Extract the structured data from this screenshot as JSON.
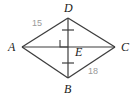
{
  "figure": {
    "name": "rhombus-abcd-with-diagonals",
    "shape_type": "rhombus",
    "vertices": [
      {
        "id": "A",
        "label": "A",
        "x": 22,
        "y": 47,
        "label_x": 8,
        "label_y": 51
      },
      {
        "id": "D",
        "label": "D",
        "x": 68,
        "y": 18,
        "label_x": 64,
        "label_y": 12
      },
      {
        "id": "C",
        "label": "C",
        "x": 115,
        "y": 47,
        "label_x": 121,
        "label_y": 51
      },
      {
        "id": "B",
        "label": "B",
        "x": 68,
        "y": 78,
        "label_x": 64,
        "label_y": 93
      }
    ],
    "intersection": {
      "id": "E",
      "label": "E",
      "x": 68,
      "y": 47,
      "label_x": 75,
      "label_y": 56
    },
    "sides": [
      {
        "from": "A",
        "to": "D"
      },
      {
        "from": "D",
        "to": "C"
      },
      {
        "from": "C",
        "to": "B"
      },
      {
        "from": "B",
        "to": "A"
      }
    ],
    "diagonals": [
      {
        "from": "A",
        "to": "C",
        "name": "horizontal-diagonal"
      },
      {
        "from": "D",
        "to": "B",
        "name": "vertical-diagonal"
      }
    ],
    "measures": [
      {
        "id": "side-ad-length",
        "value": "15",
        "segment": "AD",
        "x": 38,
        "y": 23
      },
      {
        "id": "side-bc-length",
        "value": "18",
        "segment": "BC",
        "x": 93,
        "y": 71
      }
    ],
    "marks": {
      "right_angle": {
        "present": true,
        "at": "E",
        "size": 7
      },
      "congruent_ticks": [
        {
          "segment": "DE",
          "x": 68,
          "y": 30
        },
        {
          "segment": "EB",
          "x": 68,
          "y": 63
        }
      ]
    },
    "colors": {
      "stroke": "#3d3d3d",
      "label_text": "#1a1a1a",
      "measure_text": "#9a9a9a",
      "background": "#ffffff"
    }
  }
}
